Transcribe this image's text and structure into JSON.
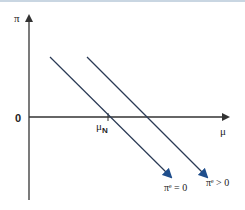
{
  "diagram": {
    "axes": {
      "y_label": "π",
      "x_label": "μ",
      "origin_label": "0"
    },
    "tick": {
      "label_main": "μ",
      "label_sub": "N"
    },
    "curves": [
      {
        "name": "curve-expected-zero",
        "label": "πᵉ = 0"
      },
      {
        "name": "curve-expected-positive",
        "label": "πᵉ > 0"
      }
    ],
    "colors": {
      "axis": "#333333",
      "line": "#2a3a55",
      "arrowhead": "#1f4e8c",
      "topbar": "#c9d6e2"
    }
  }
}
